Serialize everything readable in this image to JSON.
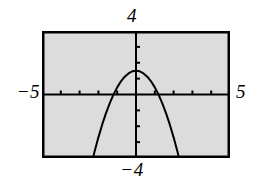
{
  "figure": {
    "kind": "graphing-calculator-screen",
    "background_color": "#ffffff",
    "screen_fill_color": "#dcdcdc",
    "ink_color": "#000000",
    "frame_border_color": "#000000"
  },
  "labels": {
    "y_max": "4",
    "y_min": "−4",
    "x_min": "−5",
    "x_max": "5"
  },
  "chart_data": {
    "type": "line",
    "title": "",
    "xlabel": "",
    "ylabel": "",
    "xlim": [
      -5,
      5
    ],
    "ylim": [
      -4,
      4
    ],
    "grid": false,
    "legend": null,
    "axes": {
      "x_axis_at_y": 0,
      "y_axis_at_x": 0,
      "x_tick_interval": 1,
      "y_tick_interval": 1,
      "x_ticks": [
        -4,
        -3,
        -2,
        -1,
        1,
        2,
        3,
        4
      ],
      "y_ticks": [
        -3,
        -2,
        -1,
        1,
        2,
        3
      ],
      "tick_length_px": 4
    },
    "series": [
      {
        "name": "parabola",
        "shape": "downward-parabola",
        "equation_a": -1.05,
        "equation_b": 0,
        "equation_c": 1.5,
        "vertex": [
          0,
          1.5
        ],
        "roots": [
          -1.2,
          1.2
        ],
        "x_domain": [
          -2.4,
          2.4
        ],
        "x": [
          -2.4,
          -2.2,
          -2.0,
          -1.8,
          -1.6,
          -1.4,
          -1.2,
          -1.0,
          -0.8,
          -0.6,
          -0.4,
          -0.2,
          0,
          0.2,
          0.4,
          0.6,
          0.8,
          1.0,
          1.2,
          1.4,
          1.6,
          1.8,
          2.0,
          2.2,
          2.4
        ],
        "y": [
          -4.55,
          -3.58,
          -2.7,
          -1.9,
          -1.19,
          -0.56,
          -0.01,
          0.45,
          0.83,
          1.12,
          1.33,
          1.46,
          1.5,
          1.46,
          1.33,
          1.12,
          0.83,
          0.45,
          -0.01,
          -0.56,
          -1.19,
          -1.9,
          -2.7,
          -3.58,
          -4.55
        ],
        "color": "#000000",
        "line_width_px": 2
      }
    ]
  }
}
